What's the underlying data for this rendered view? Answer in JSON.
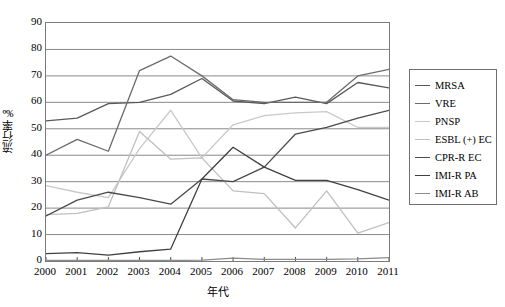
{
  "chart_data": {
    "type": "line",
    "title": "",
    "xlabel": "年代",
    "ylabel": "流行率‰",
    "x": [
      "2000",
      "2001",
      "2002",
      "2003",
      "2004",
      "2005",
      "2006",
      "2007",
      "2008",
      "2009",
      "2010",
      "2011"
    ],
    "categories": [
      "2000",
      "2001",
      "2002",
      "2003",
      "2004",
      "2005",
      "2006",
      "2007",
      "2008",
      "2009",
      "2010",
      "2011"
    ],
    "ylim": [
      0,
      90
    ],
    "xlim": [
      "2000",
      "2011"
    ],
    "yticks": [
      0,
      10,
      20,
      30,
      40,
      50,
      60,
      70,
      80,
      90
    ],
    "grid": "horizontal",
    "legend_position": "right-outside",
    "series": [
      {
        "name": "MRSA",
        "color": "#595959",
        "values": [
          53.0,
          54.0,
          59.5,
          60.0,
          63.0,
          69.0,
          60.5,
          59.5,
          62.0,
          59.5,
          67.5,
          65.5
        ]
      },
      {
        "name": "VRE",
        "color": "#6b6b6b",
        "values": [
          40.0,
          46.0,
          41.5,
          72.0,
          77.5,
          70.0,
          61.0,
          60.0,
          60.0,
          60.0,
          70.0,
          72.5
        ]
      },
      {
        "name": "PNSP",
        "color": "#c9c9c9",
        "values": [
          28.5,
          26.0,
          24.0,
          42.5,
          57.0,
          39.0,
          51.5,
          55.0,
          56.0,
          56.5,
          50.5,
          50.5
        ]
      },
      {
        "name": "ESBL (+) EC",
        "color": "#bfbfbf",
        "values": [
          17.5,
          18.0,
          20.5,
          49.0,
          38.5,
          39.0,
          26.5,
          25.5,
          12.5,
          26.5,
          10.5,
          14.5
        ]
      },
      {
        "name": "CPR-R EC",
        "color": "#4a4a4a",
        "values": [
          17.0,
          23.0,
          26.0,
          24.0,
          21.5,
          31.0,
          30.0,
          35.5,
          48.0,
          50.5,
          54.0,
          57.0
        ]
      },
      {
        "name": "IMI-R PA",
        "color": "#404040",
        "values": [
          2.8,
          3.2,
          2.2,
          3.5,
          4.5,
          31.0,
          43.0,
          35.5,
          30.5,
          30.5,
          27.0,
          23.0
        ]
      },
      {
        "name": "IMI-R AB",
        "color": "#8c8c8c",
        "values": [
          0.2,
          0.2,
          0.2,
          0.2,
          0.2,
          0.3,
          1.1,
          0.6,
          0.6,
          0.6,
          0.8,
          1.3
        ]
      }
    ]
  },
  "legend": {
    "items": [
      {
        "label": "MRSA",
        "color": "#595959"
      },
      {
        "label": "VRE",
        "color": "#6b6b6b"
      },
      {
        "label": "PNSP",
        "color": "#c9c9c9"
      },
      {
        "label": "ESBL (+) EC",
        "color": "#bfbfbf"
      },
      {
        "label": "CPR-R EC",
        "color": "#4a4a4a"
      },
      {
        "label": "IMI-R PA",
        "color": "#404040"
      },
      {
        "label": "IMI-R AB",
        "color": "#8c8c8c"
      }
    ]
  },
  "axes": {
    "y_title": "流行率‰",
    "x_title": "年代",
    "y_ticks": [
      "0",
      "10",
      "20",
      "30",
      "40",
      "50",
      "60",
      "70",
      "80",
      "90"
    ],
    "x_ticks": [
      "2000",
      "2001",
      "2002",
      "2003",
      "2004",
      "2005",
      "2006",
      "2007",
      "2008",
      "2009",
      "2010",
      "2011"
    ]
  },
  "style": {
    "grid_color": "#8a8a8a",
    "frame_color": "#7a7a7a",
    "background": "#ffffff"
  }
}
